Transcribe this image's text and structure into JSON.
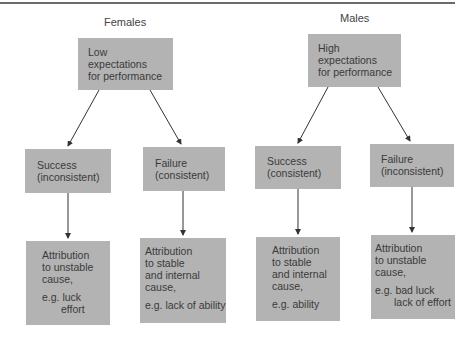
{
  "females": {
    "label": "Females",
    "top": {
      "lines": [
        "Low",
        "expectations",
        "for performance"
      ]
    },
    "success": {
      "lines": [
        "Success",
        "(inconsistent)"
      ]
    },
    "failure": {
      "lines": [
        "Failure",
        "(consistent)"
      ]
    },
    "success_attribution": {
      "lines": [
        "Attribution",
        "to unstable",
        "cause,"
      ],
      "example": [
        "e.g. luck",
        "effort"
      ]
    },
    "failure_attribution": {
      "lines": [
        "Attribution",
        "to stable",
        "and internal",
        "cause,"
      ],
      "example": [
        "e.g. lack of ability"
      ]
    }
  },
  "males": {
    "label": "Males",
    "top": {
      "lines": [
        "High",
        "expectations",
        "for performance"
      ]
    },
    "success": {
      "lines": [
        "Success",
        "(consistent)"
      ]
    },
    "failure": {
      "lines": [
        "Failure",
        "(inconsistent)"
      ]
    },
    "success_attribution": {
      "lines": [
        "Attribution",
        "to stable",
        "and internal",
        "cause,"
      ],
      "example": [
        "e.g. ability"
      ]
    },
    "failure_attribution": {
      "lines": [
        "Attribution",
        "to unstable",
        "cause,"
      ],
      "example": [
        "e.g. bad luck",
        "lack of effort"
      ]
    }
  },
  "colors": {
    "box_fill": "#b3b3b3",
    "arrow": "#333333",
    "rule": "#6a6a6a"
  }
}
